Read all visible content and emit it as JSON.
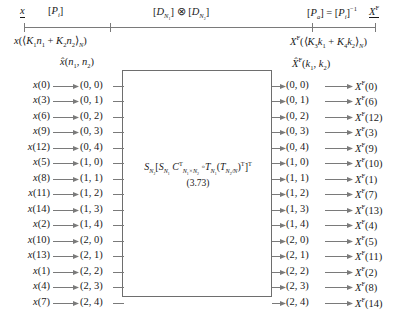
{
  "figure": {
    "top_axis": {
      "left_var": "x",
      "left_transform": "[P_i]",
      "center_transform": "[D_N1] ⊗ [D_N2]",
      "right_transform": "[P_a] = [P_i]^-1",
      "right_var": "X^F",
      "left_function": "x((K1n1 + K2n2)_N)",
      "right_function": "X^F((K3k1 + K4k2)_N)"
    },
    "column_headers": {
      "input": "x̂(n1, n2)",
      "output": "X̂^F(k1, k2)"
    },
    "box": {
      "formula": "S_N2[S_N1 C^T_{N1×N2} ∘ T_N1 (T_{N2/N})^T]^T",
      "equation_number": "(3.73)"
    },
    "rows": [
      {
        "in": "x(0)",
        "in_index": "0",
        "pair": "(0, 0)",
        "out": "X^F(0)",
        "out_index": "0"
      },
      {
        "in": "x(3)",
        "in_index": "3",
        "pair": "(0, 1)",
        "out": "X^F(6)",
        "out_index": "6"
      },
      {
        "in": "x(6)",
        "in_index": "6",
        "pair": "(0, 2)",
        "out": "X^F(12)",
        "out_index": "12"
      },
      {
        "in": "x(9)",
        "in_index": "9",
        "pair": "(0, 3)",
        "out": "X^F(3)",
        "out_index": "3"
      },
      {
        "in": "x(12)",
        "in_index": "12",
        "pair": "(0, 4)",
        "out": "X^F(9)",
        "out_index": "9"
      },
      {
        "in": "x(5)",
        "in_index": "5",
        "pair": "(1, 0)",
        "out": "X^F(10)",
        "out_index": "10"
      },
      {
        "in": "x(8)",
        "in_index": "8",
        "pair": "(1, 1)",
        "out": "X^F(1)",
        "out_index": "1"
      },
      {
        "in": "x(11)",
        "in_index": "11",
        "pair": "(1, 2)",
        "out": "X^F(7)",
        "out_index": "7"
      },
      {
        "in": "x(14)",
        "in_index": "14",
        "pair": "(1, 3)",
        "out": "X^F(13)",
        "out_index": "13"
      },
      {
        "in": "x(2)",
        "in_index": "2",
        "pair": "(1, 4)",
        "out": "X^F(4)",
        "out_index": "4"
      },
      {
        "in": "x(10)",
        "in_index": "10",
        "pair": "(2, 0)",
        "out": "X^F(5)",
        "out_index": "5"
      },
      {
        "in": "x(13)",
        "in_index": "13",
        "pair": "(2, 1)",
        "out": "X^F(11)",
        "out_index": "11"
      },
      {
        "in": "x(1)",
        "in_index": "1",
        "pair": "(2, 2)",
        "out": "X^F(2)",
        "out_index": "2"
      },
      {
        "in": "x(4)",
        "in_index": "4",
        "pair": "(2, 3)",
        "out": "X^F(8)",
        "out_index": "8"
      },
      {
        "in": "x(7)",
        "in_index": "7",
        "pair": "(2, 4)",
        "out": "X^F(14)",
        "out_index": "14"
      }
    ],
    "colors": {
      "line": "#7a7a7a",
      "box_border": "#6e6e6e",
      "text": "#1a1a1a",
      "background": "#ffffff"
    }
  }
}
